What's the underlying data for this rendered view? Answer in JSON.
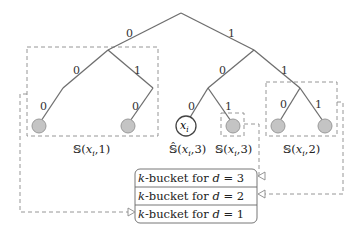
{
  "diagram": {
    "type": "binary-trie-kbuckets",
    "edges": [
      {
        "from": "root",
        "to": "n0",
        "bit": "0"
      },
      {
        "from": "root",
        "to": "n1",
        "bit": "1"
      },
      {
        "from": "n0",
        "to": "n00",
        "bit": "0"
      },
      {
        "from": "n0",
        "to": "n01",
        "bit": "1"
      },
      {
        "from": "n00",
        "to": "leaf000",
        "bit": "0"
      },
      {
        "from": "n01",
        "to": "leaf010",
        "bit": "0"
      },
      {
        "from": "n1",
        "to": "n10",
        "bit": "0"
      },
      {
        "from": "n1",
        "to": "n11",
        "bit": "1"
      },
      {
        "from": "n10",
        "to": "xi",
        "bit": "0"
      },
      {
        "from": "n10",
        "to": "leaf101",
        "bit": "1"
      },
      {
        "from": "n11",
        "to": "leaf110",
        "bit": "0"
      },
      {
        "from": "n11",
        "to": "leaf111",
        "bit": "1"
      }
    ],
    "self_node": {
      "label": "x",
      "subscript": "i"
    },
    "sets": [
      {
        "id": "S1",
        "prefix": "𝕊(",
        "var": "x",
        "sub": "i",
        "suffix": ",1)"
      },
      {
        "id": "Shat3",
        "prefix": "𝕊̂(",
        "var": "x",
        "sub": "i",
        "suffix": ",3)"
      },
      {
        "id": "S3",
        "prefix": "𝕊(",
        "var": "x",
        "sub": "i",
        "suffix": ",3)"
      },
      {
        "id": "S2",
        "prefix": "𝕊(",
        "var": "x",
        "sub": "i",
        "suffix": ",2)"
      }
    ],
    "buckets": [
      {
        "k": "k",
        "text": "-bucket for ",
        "d": "d",
        "eq": " = 3"
      },
      {
        "k": "k",
        "text": "-bucket for ",
        "d": "d",
        "eq": " = 2"
      },
      {
        "k": "k",
        "text": "-bucket for ",
        "d": "d",
        "eq": " = 1"
      }
    ],
    "mappings": [
      {
        "set": "S3",
        "bucket": "d = 3"
      },
      {
        "set": "S2",
        "bucket": "d = 2"
      },
      {
        "set": "S1",
        "bucket": "d = 1"
      }
    ],
    "colors": {
      "edge": "#6e6e6e",
      "leaf_fill": "#c4c4c4",
      "dash": "#8a8a8a"
    }
  }
}
